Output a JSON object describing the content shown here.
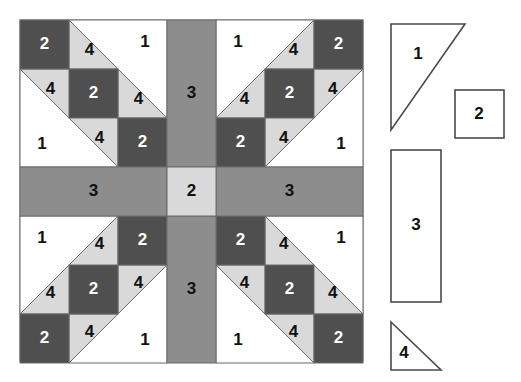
{
  "diagram": {
    "colors": {
      "background": "#ffffff",
      "fabric_white": "#ffffff",
      "fabric_light_gray": "#d9d9d9",
      "fabric_medium_gray": "#8d8d8d",
      "fabric_dark_gray": "#4f4f4f",
      "outline": "#6b6b6b",
      "legend_outline": "#4a4a4a",
      "label_light": "#ffffff",
      "label_dark": "#111111"
    },
    "block": {
      "x": 20,
      "y": 20,
      "width": 343,
      "height": 341,
      "grid_columns": 7,
      "grid_rows": 7,
      "cell_size": 49,
      "center_label": "2",
      "bar_labels": [
        "3",
        "3",
        "3",
        "3"
      ],
      "quadrant_labels": [
        "2",
        "4",
        "1",
        "4",
        "2",
        "4",
        "1",
        "4",
        "2"
      ]
    },
    "legend": {
      "pieces": [
        {
          "id": "piece-1",
          "label": "1",
          "shape": "triangle-large"
        },
        {
          "id": "piece-2",
          "label": "2",
          "shape": "square"
        },
        {
          "id": "piece-3",
          "label": "3",
          "shape": "rectangle-tall"
        },
        {
          "id": "piece-4",
          "label": "4",
          "shape": "triangle-small"
        }
      ]
    }
  }
}
